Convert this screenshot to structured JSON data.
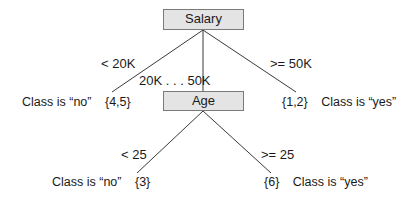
{
  "tree": {
    "root": {
      "label": "Salary",
      "edges": [
        {
          "condition": "< 20K"
        },
        {
          "condition": "20K . . . 50K"
        },
        {
          "condition": ">= 50K"
        }
      ]
    },
    "age_node": {
      "label": "Age",
      "edges": [
        {
          "condition": "< 25"
        },
        {
          "condition": ">= 25"
        }
      ]
    },
    "leaves": {
      "salary_low": {
        "class_text": "Class is “no”",
        "set": "{4,5}"
      },
      "salary_high": {
        "set": "{1,2}",
        "class_text": "Class is “yes”"
      },
      "age_low": {
        "class_text": "Class is “no”",
        "set": "{3}"
      },
      "age_high": {
        "set": "{6}",
        "class_text": "Class is “yes”"
      }
    }
  },
  "colors": {
    "node_fill": "#e4e4e4",
    "node_border": "#7a7a7a",
    "edge": "#3a3a3a",
    "text": "#1a1a1a"
  }
}
